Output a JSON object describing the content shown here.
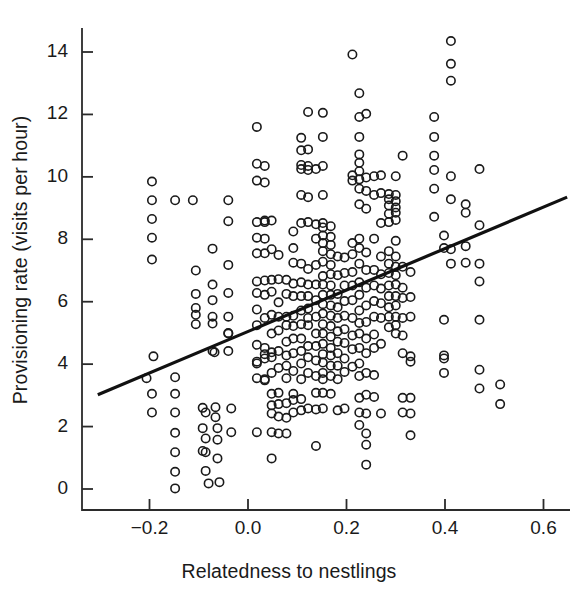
{
  "chart_data": {
    "type": "scatter",
    "title": "",
    "xlabel": "Relatedness to nestlings",
    "ylabel": "Provisioning rate (visits per hour)",
    "xlim": [
      -0.3,
      0.65
    ],
    "ylim": [
      -0.45,
      14.9
    ],
    "xticks": [
      -0.2,
      0.0,
      0.2,
      0.4,
      0.6
    ],
    "xticklabels": [
      "−0.2",
      "0.0",
      "0.2",
      "0.4",
      "0.6"
    ],
    "yticks": [
      0,
      2,
      4,
      6,
      8,
      10,
      12,
      14
    ],
    "yticklabels": [
      "0",
      "2",
      "4",
      "6",
      "8",
      "10",
      "12",
      "14"
    ],
    "grid": false,
    "legend": null,
    "marker": {
      "shape": "open-circle",
      "size": 10,
      "edge_color": "#1a1a1a",
      "face_color": "none",
      "edge_width": 1.6
    },
    "trendline": {
      "type": "linear-regression",
      "color": "#111111",
      "width": 3.2,
      "x_start": -0.305,
      "y_start": 3.02,
      "x_end": 0.648,
      "y_end": 9.35
    },
    "points": [
      [
        -0.195,
        9.85
      ],
      [
        -0.195,
        9.25
      ],
      [
        -0.195,
        8.65
      ],
      [
        -0.195,
        8.05
      ],
      [
        -0.195,
        7.35
      ],
      [
        -0.192,
        4.25
      ],
      [
        -0.206,
        3.55
      ],
      [
        -0.195,
        3.05
      ],
      [
        -0.195,
        2.45
      ],
      [
        -0.148,
        9.25
      ],
      [
        -0.148,
        3.58
      ],
      [
        -0.148,
        3.05
      ],
      [
        -0.148,
        2.45
      ],
      [
        -0.148,
        1.8
      ],
      [
        -0.148,
        1.18
      ],
      [
        -0.148,
        0.55
      ],
      [
        -0.148,
        0.02
      ],
      [
        -0.112,
        9.25
      ],
      [
        -0.106,
        7.0
      ],
      [
        -0.106,
        6.25
      ],
      [
        -0.106,
        5.8
      ],
      [
        -0.106,
        5.58
      ],
      [
        -0.106,
        5.28
      ],
      [
        -0.092,
        2.6
      ],
      [
        -0.086,
        2.45
      ],
      [
        -0.092,
        1.95
      ],
      [
        -0.086,
        1.62
      ],
      [
        -0.092,
        1.22
      ],
      [
        -0.086,
        1.18
      ],
      [
        -0.086,
        0.58
      ],
      [
        -0.08,
        0.18
      ],
      [
        -0.072,
        7.7
      ],
      [
        -0.072,
        6.55
      ],
      [
        -0.072,
        6.05
      ],
      [
        -0.072,
        5.52
      ],
      [
        -0.072,
        5.3
      ],
      [
        -0.072,
        4.42
      ],
      [
        -0.068,
        4.38
      ],
      [
        -0.066,
        2.62
      ],
      [
        -0.066,
        2.3
      ],
      [
        -0.062,
        1.95
      ],
      [
        -0.062,
        1.58
      ],
      [
        -0.062,
        0.98
      ],
      [
        -0.058,
        0.22
      ],
      [
        -0.04,
        9.25
      ],
      [
        -0.04,
        8.58
      ],
      [
        -0.04,
        7.18
      ],
      [
        -0.04,
        6.28
      ],
      [
        -0.04,
        5.52
      ],
      [
        -0.04,
        5.0
      ],
      [
        -0.04,
        4.98
      ],
      [
        -0.04,
        4.42
      ],
      [
        -0.034,
        2.58
      ],
      [
        -0.034,
        1.82
      ],
      [
        0.018,
        11.6
      ],
      [
        0.018,
        10.42
      ],
      [
        0.018,
        9.88
      ],
      [
        0.018,
        8.55
      ],
      [
        0.018,
        8.05
      ],
      [
        0.018,
        7.55
      ],
      [
        0.018,
        6.65
      ],
      [
        0.018,
        6.28
      ],
      [
        0.018,
        5.75
      ],
      [
        0.018,
        5.25
      ],
      [
        0.018,
        4.62
      ],
      [
        0.018,
        4.08
      ],
      [
        0.018,
        4.02
      ],
      [
        0.018,
        3.55
      ],
      [
        0.018,
        1.82
      ],
      [
        0.034,
        10.35
      ],
      [
        0.034,
        9.82
      ],
      [
        0.034,
        8.6
      ],
      [
        0.034,
        8.55
      ],
      [
        0.034,
        8.02
      ],
      [
        0.034,
        7.55
      ],
      [
        0.034,
        6.68
      ],
      [
        0.034,
        6.22
      ],
      [
        0.034,
        5.48
      ],
      [
        0.034,
        4.52
      ],
      [
        0.034,
        4.32
      ],
      [
        0.034,
        4.18
      ],
      [
        0.034,
        3.52
      ],
      [
        0.034,
        3.48
      ],
      [
        0.048,
        8.6
      ],
      [
        0.048,
        7.68
      ],
      [
        0.048,
        6.7
      ],
      [
        0.048,
        6.32
      ],
      [
        0.048,
        5.58
      ],
      [
        0.048,
        4.98
      ],
      [
        0.048,
        4.38
      ],
      [
        0.048,
        4.22
      ],
      [
        0.048,
        3.72
      ],
      [
        0.048,
        3.05
      ],
      [
        0.048,
        2.68
      ],
      [
        0.048,
        2.42
      ],
      [
        0.048,
        1.82
      ],
      [
        0.048,
        0.98
      ],
      [
        0.062,
        7.5
      ],
      [
        0.062,
        6.72
      ],
      [
        0.062,
        5.98
      ],
      [
        0.062,
        5.52
      ],
      [
        0.062,
        5.08
      ],
      [
        0.062,
        4.42
      ],
      [
        0.062,
        3.88
      ],
      [
        0.062,
        3.08
      ],
      [
        0.062,
        2.72
      ],
      [
        0.062,
        2.32
      ],
      [
        0.062,
        1.78
      ],
      [
        0.078,
        6.7
      ],
      [
        0.078,
        6.25
      ],
      [
        0.078,
        5.52
      ],
      [
        0.078,
        5.25
      ],
      [
        0.078,
        4.72
      ],
      [
        0.078,
        4.28
      ],
      [
        0.078,
        3.95
      ],
      [
        0.078,
        3.55
      ],
      [
        0.078,
        2.75
      ],
      [
        0.078,
        2.28
      ],
      [
        0.078,
        1.78
      ],
      [
        0.092,
        8.25
      ],
      [
        0.092,
        7.72
      ],
      [
        0.092,
        7.25
      ],
      [
        0.092,
        6.58
      ],
      [
        0.092,
        6.18
      ],
      [
        0.092,
        5.55
      ],
      [
        0.092,
        5.22
      ],
      [
        0.092,
        4.82
      ],
      [
        0.092,
        4.35
      ],
      [
        0.092,
        3.78
      ],
      [
        0.092,
        3.05
      ],
      [
        0.092,
        2.85
      ],
      [
        0.092,
        2.45
      ],
      [
        0.108,
        11.25
      ],
      [
        0.108,
        10.85
      ],
      [
        0.108,
        10.38
      ],
      [
        0.108,
        10.25
      ],
      [
        0.108,
        9.42
      ],
      [
        0.108,
        8.52
      ],
      [
        0.108,
        7.22
      ],
      [
        0.108,
        6.62
      ],
      [
        0.108,
        6.18
      ],
      [
        0.108,
        5.72
      ],
      [
        0.108,
        5.28
      ],
      [
        0.108,
        4.82
      ],
      [
        0.108,
        4.42
      ],
      [
        0.108,
        4.02
      ],
      [
        0.108,
        3.52
      ],
      [
        0.108,
        2.88
      ],
      [
        0.108,
        2.52
      ],
      [
        0.122,
        12.08
      ],
      [
        0.122,
        10.88
      ],
      [
        0.122,
        10.35
      ],
      [
        0.122,
        10.22
      ],
      [
        0.122,
        9.35
      ],
      [
        0.122,
        8.55
      ],
      [
        0.122,
        7.05
      ],
      [
        0.122,
        6.55
      ],
      [
        0.122,
        6.18
      ],
      [
        0.122,
        5.78
      ],
      [
        0.122,
        5.48
      ],
      [
        0.122,
        5.25
      ],
      [
        0.122,
        4.58
      ],
      [
        0.122,
        4.22
      ],
      [
        0.122,
        3.72
      ],
      [
        0.122,
        2.58
      ],
      [
        0.138,
        10.25
      ],
      [
        0.138,
        8.48
      ],
      [
        0.138,
        8.02
      ],
      [
        0.138,
        7.18
      ],
      [
        0.138,
        6.55
      ],
      [
        0.138,
        6.05
      ],
      [
        0.138,
        5.52
      ],
      [
        0.138,
        4.98
      ],
      [
        0.138,
        4.58
      ],
      [
        0.138,
        4.12
      ],
      [
        0.138,
        3.62
      ],
      [
        0.138,
        3.08
      ],
      [
        0.138,
        2.55
      ],
      [
        0.138,
        1.38
      ],
      [
        0.152,
        12.05
      ],
      [
        0.152,
        11.28
      ],
      [
        0.152,
        10.35
      ],
      [
        0.152,
        9.42
      ],
      [
        0.152,
        8.52
      ],
      [
        0.152,
        8.38
      ],
      [
        0.152,
        8.12
      ],
      [
        0.152,
        7.88
      ],
      [
        0.152,
        7.62
      ],
      [
        0.152,
        7.28
      ],
      [
        0.152,
        6.82
      ],
      [
        0.152,
        6.55
      ],
      [
        0.152,
        6.22
      ],
      [
        0.152,
        5.92
      ],
      [
        0.152,
        5.62
      ],
      [
        0.152,
        5.28
      ],
      [
        0.152,
        4.98
      ],
      [
        0.152,
        4.65
      ],
      [
        0.152,
        4.32
      ],
      [
        0.152,
        4.05
      ],
      [
        0.152,
        3.72
      ],
      [
        0.152,
        3.52
      ],
      [
        0.152,
        3.08
      ],
      [
        0.152,
        2.58
      ],
      [
        0.168,
        8.42
      ],
      [
        0.168,
        8.08
      ],
      [
        0.168,
        7.82
      ],
      [
        0.168,
        7.52
      ],
      [
        0.168,
        7.18
      ],
      [
        0.168,
        6.88
      ],
      [
        0.168,
        6.52
      ],
      [
        0.168,
        6.22
      ],
      [
        0.168,
        5.88
      ],
      [
        0.168,
        5.55
      ],
      [
        0.168,
        5.22
      ],
      [
        0.168,
        4.88
      ],
      [
        0.168,
        4.52
      ],
      [
        0.168,
        4.28
      ],
      [
        0.168,
        3.95
      ],
      [
        0.168,
        3.62
      ],
      [
        0.168,
        3.05
      ],
      [
        0.182,
        7.45
      ],
      [
        0.182,
        6.85
      ],
      [
        0.182,
        6.25
      ],
      [
        0.182,
        5.82
      ],
      [
        0.182,
        5.48
      ],
      [
        0.182,
        5.05
      ],
      [
        0.182,
        4.72
      ],
      [
        0.182,
        4.35
      ],
      [
        0.182,
        3.95
      ],
      [
        0.182,
        3.52
      ],
      [
        0.182,
        2.52
      ],
      [
        0.196,
        7.42
      ],
      [
        0.196,
        6.92
      ],
      [
        0.196,
        6.52
      ],
      [
        0.196,
        6.02
      ],
      [
        0.196,
        5.55
      ],
      [
        0.196,
        5.12
      ],
      [
        0.196,
        4.68
      ],
      [
        0.196,
        4.18
      ],
      [
        0.196,
        3.75
      ],
      [
        0.196,
        2.58
      ],
      [
        0.212,
        13.92
      ],
      [
        0.212,
        10.05
      ],
      [
        0.212,
        9.88
      ],
      [
        0.212,
        7.88
      ],
      [
        0.212,
        7.52
      ],
      [
        0.212,
        6.95
      ],
      [
        0.212,
        6.52
      ],
      [
        0.212,
        6.05
      ],
      [
        0.212,
        5.48
      ],
      [
        0.212,
        4.92
      ],
      [
        0.212,
        4.48
      ],
      [
        0.212,
        3.92
      ],
      [
        0.226,
        12.68
      ],
      [
        0.226,
        11.92
      ],
      [
        0.226,
        11.28
      ],
      [
        0.226,
        10.72
      ],
      [
        0.226,
        10.45
      ],
      [
        0.226,
        10.18
      ],
      [
        0.226,
        9.92
      ],
      [
        0.226,
        9.62
      ],
      [
        0.226,
        9.12
      ],
      [
        0.226,
        8.02
      ],
      [
        0.226,
        7.72
      ],
      [
        0.226,
        7.22
      ],
      [
        0.226,
        6.62
      ],
      [
        0.226,
        6.22
      ],
      [
        0.226,
        5.72
      ],
      [
        0.226,
        5.32
      ],
      [
        0.226,
        4.98
      ],
      [
        0.226,
        4.52
      ],
      [
        0.226,
        4.02
      ],
      [
        0.226,
        3.62
      ],
      [
        0.226,
        2.92
      ],
      [
        0.226,
        2.45
      ],
      [
        0.226,
        2.05
      ],
      [
        0.24,
        12.02
      ],
      [
        0.24,
        9.98
      ],
      [
        0.24,
        9.55
      ],
      [
        0.24,
        8.98
      ],
      [
        0.24,
        7.58
      ],
      [
        0.24,
        7.02
      ],
      [
        0.24,
        6.45
      ],
      [
        0.24,
        5.88
      ],
      [
        0.24,
        5.35
      ],
      [
        0.24,
        4.82
      ],
      [
        0.24,
        4.35
      ],
      [
        0.24,
        3.72
      ],
      [
        0.24,
        3.02
      ],
      [
        0.24,
        2.42
      ],
      [
        0.24,
        1.78
      ],
      [
        0.24,
        1.42
      ],
      [
        0.24,
        0.78
      ],
      [
        0.256,
        10.02
      ],
      [
        0.256,
        9.42
      ],
      [
        0.256,
        8.02
      ],
      [
        0.256,
        7.02
      ],
      [
        0.256,
        6.52
      ],
      [
        0.256,
        6.02
      ],
      [
        0.256,
        5.52
      ],
      [
        0.256,
        4.95
      ],
      [
        0.256,
        4.52
      ],
      [
        0.256,
        3.65
      ],
      [
        0.256,
        2.95
      ],
      [
        0.27,
        10.05
      ],
      [
        0.27,
        9.48
      ],
      [
        0.27,
        8.52
      ],
      [
        0.27,
        7.45
      ],
      [
        0.27,
        6.88
      ],
      [
        0.27,
        6.42
      ],
      [
        0.27,
        5.95
      ],
      [
        0.27,
        5.48
      ],
      [
        0.27,
        4.65
      ],
      [
        0.27,
        2.42
      ],
      [
        0.286,
        9.45
      ],
      [
        0.286,
        9.28
      ],
      [
        0.286,
        9.08
      ],
      [
        0.286,
        8.82
      ],
      [
        0.286,
        8.55
      ],
      [
        0.286,
        7.62
      ],
      [
        0.286,
        7.22
      ],
      [
        0.286,
        6.92
      ],
      [
        0.286,
        6.52
      ],
      [
        0.286,
        6.18
      ],
      [
        0.286,
        5.82
      ],
      [
        0.286,
        5.52
      ],
      [
        0.286,
        5.18
      ],
      [
        0.3,
        10.02
      ],
      [
        0.3,
        9.42
      ],
      [
        0.3,
        9.22
      ],
      [
        0.3,
        9.02
      ],
      [
        0.3,
        8.85
      ],
      [
        0.3,
        8.62
      ],
      [
        0.3,
        7.95
      ],
      [
        0.3,
        7.45
      ],
      [
        0.3,
        7.12
      ],
      [
        0.3,
        6.85
      ],
      [
        0.3,
        6.55
      ],
      [
        0.3,
        6.18
      ],
      [
        0.3,
        5.88
      ],
      [
        0.3,
        5.52
      ],
      [
        0.3,
        5.25
      ],
      [
        0.3,
        4.98
      ],
      [
        0.314,
        10.68
      ],
      [
        0.314,
        7.12
      ],
      [
        0.314,
        6.45
      ],
      [
        0.314,
        6.12
      ],
      [
        0.314,
        5.48
      ],
      [
        0.314,
        4.92
      ],
      [
        0.314,
        4.35
      ],
      [
        0.314,
        2.92
      ],
      [
        0.314,
        2.45
      ],
      [
        0.33,
        6.95
      ],
      [
        0.33,
        6.15
      ],
      [
        0.33,
        5.52
      ],
      [
        0.33,
        4.25
      ],
      [
        0.33,
        4.08
      ],
      [
        0.33,
        2.92
      ],
      [
        0.33,
        2.42
      ],
      [
        0.33,
        1.72
      ],
      [
        0.378,
        11.92
      ],
      [
        0.378,
        11.28
      ],
      [
        0.378,
        10.68
      ],
      [
        0.378,
        10.22
      ],
      [
        0.378,
        9.62
      ],
      [
        0.378,
        8.72
      ],
      [
        0.398,
        8.12
      ],
      [
        0.398,
        7.72
      ],
      [
        0.398,
        5.42
      ],
      [
        0.398,
        4.28
      ],
      [
        0.398,
        4.18
      ],
      [
        0.398,
        3.72
      ],
      [
        0.412,
        14.35
      ],
      [
        0.412,
        13.62
      ],
      [
        0.412,
        13.08
      ],
      [
        0.412,
        10.02
      ],
      [
        0.412,
        9.28
      ],
      [
        0.412,
        7.68
      ],
      [
        0.412,
        7.22
      ],
      [
        0.442,
        9.12
      ],
      [
        0.442,
        8.85
      ],
      [
        0.442,
        7.78
      ],
      [
        0.442,
        7.25
      ],
      [
        0.47,
        10.25
      ],
      [
        0.47,
        8.45
      ],
      [
        0.47,
        7.22
      ],
      [
        0.47,
        6.65
      ],
      [
        0.47,
        5.42
      ],
      [
        0.47,
        3.82
      ],
      [
        0.47,
        3.22
      ],
      [
        0.512,
        3.35
      ],
      [
        0.512,
        2.72
      ]
    ]
  },
  "axes": {
    "x_tick_labels": [
      "−0.2",
      "0.0",
      "0.2",
      "0.4",
      "0.6"
    ],
    "y_tick_labels": [
      "0",
      "2",
      "4",
      "6",
      "8",
      "10",
      "12",
      "14"
    ],
    "x_title": "Relatedness to nestlings",
    "y_title": "Provisioning rate (visits per hour)"
  }
}
